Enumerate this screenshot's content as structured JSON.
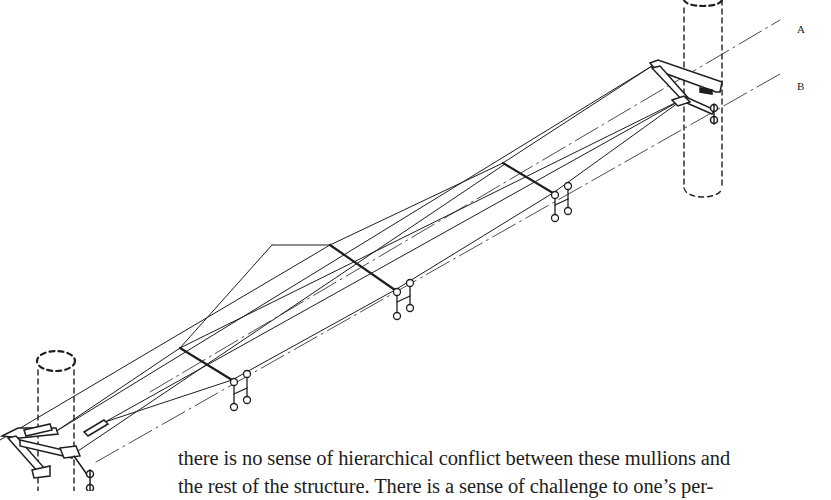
{
  "figure": {
    "type": "isometric technical drawing",
    "axis_labels": [
      {
        "id": "A",
        "text": "A"
      },
      {
        "id": "B",
        "text": "B"
      }
    ],
    "components": {
      "columns": 2,
      "spacer_bars": 3,
      "glazing_brackets": 3,
      "end_brackets": 2,
      "tension_rods": 4,
      "center_lines": 2
    },
    "colors": {
      "ink": "#1e1e1e",
      "background": "#ffffff"
    }
  },
  "text": {
    "lines": [
      "there is no sense of hierarchical conflict between these mullions and",
      "the rest of the structure. There is a sense of challenge to one’s per-"
    ]
  }
}
